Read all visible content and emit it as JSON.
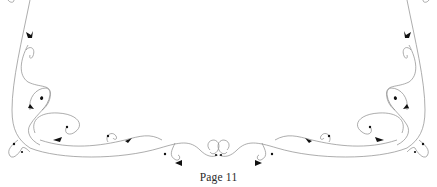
{
  "page": {
    "number_label": "Page 11"
  },
  "ornament": {
    "name": "floral-vine-border",
    "line_color": "#8a8a8a",
    "leaf_color": "#111111"
  }
}
